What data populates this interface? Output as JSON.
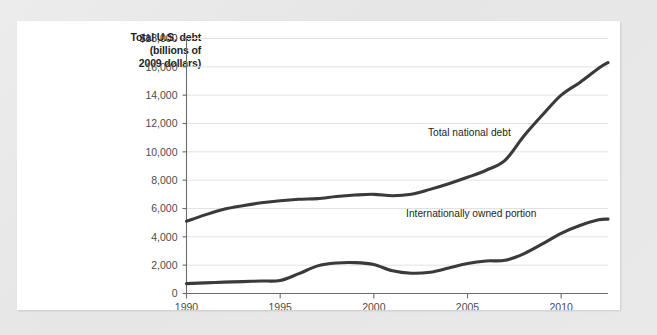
{
  "figure": {
    "background_color": "#e9e9e9",
    "panel_color": "#ffffff"
  },
  "title_lines": [
    "Total U.S. debt",
    "(billions of",
    "2009 dollars)"
  ],
  "title_line_1": "Total U.S. debt",
  "title_line_2": "(billions of",
  "title_line_3": "2009 dollars)",
  "chart_data": {
    "type": "line",
    "title": "Total U.S. debt (billions of 2009 dollars)",
    "xlabel": "",
    "ylabel": "Total U.S. debt (billions of 2009 dollars)",
    "xlim": [
      1990,
      2012.5
    ],
    "ylim": [
      0,
      18000
    ],
    "grid": true,
    "legend_position": "inline-annotations",
    "line_color": "#3a3a3a",
    "x_ticks": [
      1990,
      1995,
      2000,
      2005,
      2010
    ],
    "x_tick_labels": [
      "1990",
      "1995",
      "2000",
      "2005",
      "2010"
    ],
    "y_ticks": [
      0,
      2000,
      4000,
      6000,
      8000,
      10000,
      12000,
      14000,
      16000,
      18000
    ],
    "y_tick_labels": [
      "0",
      "2,000",
      "4,000",
      "6,000",
      "8,000",
      "10,000",
      "12,000",
      "14,000",
      "16,000",
      "$18,000"
    ],
    "series": [
      {
        "name": "Total national debt",
        "annotation": "Total national debt",
        "annotation_x": 2005.1,
        "annotation_y": 11400,
        "x": [
          1990,
          1991,
          1992,
          1993,
          1994,
          1995,
          1996,
          1997,
          1998,
          1999,
          2000,
          2001,
          2002,
          2003,
          2004,
          2005,
          2006,
          2007,
          2008,
          2009,
          2010,
          2011,
          2012,
          2012.5
        ],
        "values": [
          5100,
          5550,
          5950,
          6200,
          6400,
          6550,
          6650,
          6700,
          6850,
          6950,
          7000,
          6900,
          7000,
          7350,
          7750,
          8200,
          8700,
          9400,
          11100,
          12600,
          14000,
          14900,
          15900,
          16300
        ]
      },
      {
        "name": "Internationally owned portion",
        "annotation": "Internationally owned portion",
        "annotation_x": 2005.2,
        "annotation_y": 5650,
        "x": [
          1990,
          1991,
          1992,
          1993,
          1994,
          1995,
          1996,
          1997,
          1998,
          1999,
          2000,
          2001,
          2002,
          2003,
          2004,
          2005,
          2006,
          2007,
          2008,
          2009,
          2010,
          2011,
          2012,
          2012.5
        ],
        "values": [
          700,
          750,
          800,
          840,
          880,
          920,
          1400,
          1950,
          2150,
          2180,
          2050,
          1600,
          1430,
          1500,
          1800,
          2120,
          2300,
          2340,
          2800,
          3500,
          4250,
          4800,
          5200,
          5250
        ]
      }
    ]
  }
}
